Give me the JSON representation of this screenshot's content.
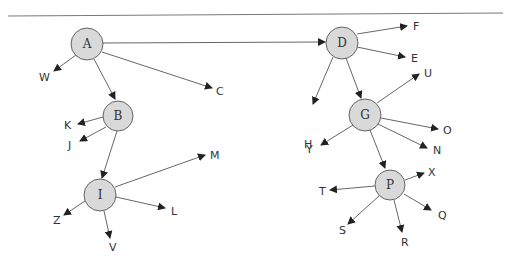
{
  "diagram": {
    "type": "directed-tree",
    "colors": {
      "node_fill": "#d9d9d9",
      "stroke": "#555555",
      "text": "#333333"
    },
    "nodes": [
      {
        "id": "A",
        "label": "A",
        "x": 87,
        "y": 44
      },
      {
        "id": "B",
        "label": "B",
        "x": 118,
        "y": 116
      },
      {
        "id": "I",
        "label": "I",
        "x": 100,
        "y": 195
      },
      {
        "id": "D",
        "label": "D",
        "x": 342,
        "y": 43
      },
      {
        "id": "G",
        "label": "G",
        "x": 365,
        "y": 115
      },
      {
        "id": "P",
        "label": "P",
        "x": 390,
        "y": 185
      }
    ],
    "leaves": [
      {
        "id": "W",
        "label": "W"
      },
      {
        "id": "C",
        "label": "C"
      },
      {
        "id": "K",
        "label": "K"
      },
      {
        "id": "J",
        "label": "J"
      },
      {
        "id": "M",
        "label": "M"
      },
      {
        "id": "L",
        "label": "L"
      },
      {
        "id": "Z",
        "label": "Z"
      },
      {
        "id": "V",
        "label": "V"
      },
      {
        "id": "F",
        "label": "F"
      },
      {
        "id": "E",
        "label": "E"
      },
      {
        "id": "U",
        "label": "U"
      },
      {
        "id": "H",
        "label": "H"
      },
      {
        "id": "O",
        "label": "O"
      },
      {
        "id": "Y",
        "label": "Y"
      },
      {
        "id": "N",
        "label": "N"
      },
      {
        "id": "X",
        "label": "X"
      },
      {
        "id": "T",
        "label": "T"
      },
      {
        "id": "Q",
        "label": "Q"
      },
      {
        "id": "S",
        "label": "S"
      },
      {
        "id": "R",
        "label": "R"
      }
    ],
    "edges": [
      [
        "A",
        "W"
      ],
      [
        "A",
        "B"
      ],
      [
        "A",
        "C"
      ],
      [
        "A",
        "D"
      ],
      [
        "B",
        "K"
      ],
      [
        "B",
        "J"
      ],
      [
        "B",
        "I"
      ],
      [
        "I",
        "M"
      ],
      [
        "I",
        "L"
      ],
      [
        "I",
        "Z"
      ],
      [
        "I",
        "V"
      ],
      [
        "D",
        "F"
      ],
      [
        "D",
        "E"
      ],
      [
        "D",
        "H"
      ],
      [
        "D",
        "G"
      ],
      [
        "G",
        "U"
      ],
      [
        "G",
        "O"
      ],
      [
        "G",
        "N"
      ],
      [
        "G",
        "Y"
      ],
      [
        "G",
        "P"
      ],
      [
        "P",
        "X"
      ],
      [
        "P",
        "T"
      ],
      [
        "P",
        "Q"
      ],
      [
        "P",
        "S"
      ],
      [
        "P",
        "R"
      ]
    ]
  }
}
